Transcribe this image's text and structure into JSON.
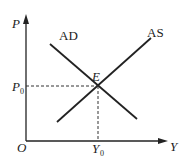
{
  "diagram": {
    "type": "AD-AS equilibrium",
    "axes": {
      "y_label": "P",
      "x_label": "Y",
      "origin_label": "O"
    },
    "curves": [
      {
        "name": "AD",
        "label": "AD",
        "direction": "downward-sloping"
      },
      {
        "name": "AS",
        "label": "AS",
        "direction": "upward-sloping"
      }
    ],
    "equilibrium": {
      "point_label": "E",
      "price_label": "P",
      "price_subscript": "0",
      "output_label": "Y",
      "output_subscript": "0"
    },
    "colors": {
      "line": "#222222",
      "dashed": "#333333",
      "background": "#ffffff"
    }
  }
}
